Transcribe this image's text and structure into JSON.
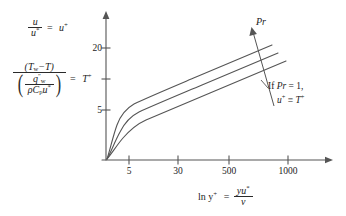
{
  "figure": {
    "kind": "law-of-the-wall-profile-sketch",
    "y_axis": {
      "ticks": [
        "20",
        "5"
      ],
      "tick_values": [
        20,
        5
      ],
      "unlabeled_ticks": 1,
      "arrow": true
    },
    "x_axis": {
      "ticks": [
        "5",
        "30",
        "500",
        "1000"
      ],
      "tick_values": [
        5,
        30,
        500,
        1000
      ],
      "arrow": true,
      "label": {
        "lead": "ln y",
        "lead_sup": "+",
        "equals": "=",
        "numerator": "yu",
        "numerator_sup": "*",
        "denominator": "ν"
      }
    },
    "y_axis_definitions": {
      "velocity": {
        "numerator": "u",
        "denominator": "u",
        "denominator_sup": "*",
        "equals": "=",
        "result": "u",
        "result_sup": "+"
      },
      "temperature": {
        "numerator": "(T",
        "numerator_sub": "w",
        "numerator_rest": "−T)",
        "den_num": "q",
        "den_num_sup": "″",
        "den_num_sub": "w",
        "den_den_rho": "ρC",
        "den_den_sub": "p",
        "den_den_u": "u",
        "den_den_sup": "*",
        "equals": "=",
        "result": "T",
        "result_sup": "+"
      }
    },
    "annotations": {
      "pr_arrow_label": "Pr",
      "note_line1_lead": "If",
      "note_line1_expr": "Pr",
      "note_line1_rest": "= 1,",
      "note_line2_lhs": "u",
      "note_line2_lhs_sup": "+",
      "note_line2_op": "≡",
      "note_line2_rhs": "T",
      "note_line2_rhs_sup": "+"
    },
    "curves": {
      "count": 3,
      "description": "three law-of-the-wall profiles rising from origin, viscous sublayer knee near y+=5-30, then log-linear region; curve spacing increases with Pr",
      "direction_of_increase": "Pr increases upward"
    },
    "colors": {
      "ink": "#2a2a2a",
      "background": "#ffffff"
    }
  }
}
